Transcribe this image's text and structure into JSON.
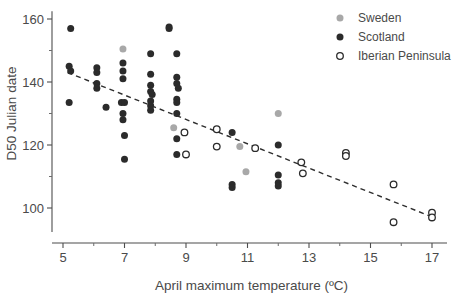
{
  "chart_data": {
    "type": "scatter",
    "title": "",
    "xlabel": "April maximum temperature (ºC)",
    "ylabel": "D50 Julian date",
    "xlim": [
      4.2,
      17.6
    ],
    "ylim": [
      88,
      162
    ],
    "xticks": [
      5,
      7,
      9,
      11,
      13,
      15,
      17
    ],
    "xtick_labels": [
      "5",
      "7",
      "9",
      "11",
      "13",
      "15",
      "17"
    ],
    "x_minor_ticks": [
      6,
      8,
      10,
      12,
      14,
      16
    ],
    "yticks": [
      100,
      120,
      140,
      160
    ],
    "ytick_labels": [
      "100",
      "120",
      "140",
      "160"
    ],
    "y_minor_ticks": [
      110,
      130,
      150
    ],
    "grid": false,
    "legend_position": "top-right",
    "legend": [
      {
        "name": "Sweden",
        "marker": "filled-circle",
        "color": "#a8a8a8"
      },
      {
        "name": "Scotland",
        "marker": "filled-circle",
        "color": "#2b2b2b"
      },
      {
        "name": "Iberian Peninsula",
        "marker": "open-circle",
        "color": "#2b2b2b"
      }
    ],
    "series": [
      {
        "name": "Sweden",
        "marker": "filled-circle",
        "color": "#a8a8a8",
        "points": [
          [
            6.95,
            150.5
          ],
          [
            8.6,
            125.5
          ],
          [
            10.75,
            119.5
          ],
          [
            10.95,
            111.5
          ],
          [
            12.0,
            130.0
          ]
        ]
      },
      {
        "name": "Scotland",
        "marker": "filled-circle",
        "color": "#2b2b2b",
        "points": [
          [
            5.25,
            157.0
          ],
          [
            5.2,
            145.0
          ],
          [
            5.25,
            143.5
          ],
          [
            5.2,
            133.5
          ],
          [
            6.1,
            144.5
          ],
          [
            6.1,
            143.0
          ],
          [
            6.1,
            139.5
          ],
          [
            6.1,
            138.0
          ],
          [
            6.4,
            132.0
          ],
          [
            6.95,
            146.0
          ],
          [
            6.95,
            143.5
          ],
          [
            6.95,
            141.0
          ],
          [
            6.9,
            133.5
          ],
          [
            7.0,
            133.5
          ],
          [
            6.95,
            130.0
          ],
          [
            6.95,
            128.0
          ],
          [
            7.0,
            123.0
          ],
          [
            7.0,
            115.5
          ],
          [
            7.85,
            149.0
          ],
          [
            7.85,
            142.5
          ],
          [
            7.85,
            139.0
          ],
          [
            7.85,
            137.0
          ],
          [
            7.9,
            136.0
          ],
          [
            7.85,
            134.0
          ],
          [
            7.85,
            132.5
          ],
          [
            7.85,
            131.0
          ],
          [
            8.45,
            157.5
          ],
          [
            8.45,
            157.0
          ],
          [
            8.7,
            149.0
          ],
          [
            8.7,
            141.5
          ],
          [
            8.7,
            139.5
          ],
          [
            8.75,
            138.0
          ],
          [
            8.7,
            134.5
          ],
          [
            8.7,
            133.5
          ],
          [
            8.7,
            130.0
          ],
          [
            8.7,
            122.0
          ],
          [
            8.7,
            117.0
          ],
          [
            10.5,
            124.0
          ],
          [
            10.5,
            107.5
          ],
          [
            10.5,
            106.5
          ],
          [
            12.0,
            120.0
          ],
          [
            12.0,
            110.5
          ],
          [
            12.0,
            108.0
          ],
          [
            12.0,
            107.0
          ]
        ]
      },
      {
        "name": "Iberian Peninsula",
        "marker": "open-circle",
        "color": "#2b2b2b",
        "points": [
          [
            8.95,
            124.0
          ],
          [
            9.0,
            117.0
          ],
          [
            10.0,
            125.0
          ],
          [
            10.0,
            119.5
          ],
          [
            11.25,
            119.0
          ],
          [
            12.75,
            114.5
          ],
          [
            12.8,
            111.0
          ],
          [
            14.2,
            117.5
          ],
          [
            14.2,
            116.5
          ],
          [
            15.75,
            107.5
          ],
          [
            15.75,
            95.5
          ],
          [
            17.0,
            98.5
          ],
          [
            17.0,
            97.0
          ]
        ]
      }
    ],
    "trendline": {
      "style": "dashed",
      "color": "#2e2e2e",
      "x_start": 5.15,
      "y_start": 143.0,
      "x_end": 17.1,
      "y_end": 96.8
    }
  }
}
